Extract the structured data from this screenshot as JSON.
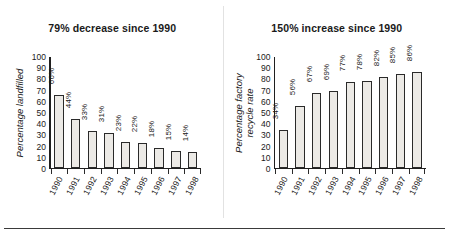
{
  "figure": {
    "bottom_rule": true,
    "divider": true
  },
  "chart_data": [
    {
      "type": "bar",
      "panel": "left",
      "title": "79% decrease since 1990",
      "ylabel": "Percentage landfilled",
      "ylabel_lines": [
        "Percentage landfilled"
      ],
      "xlabel": "",
      "categories": [
        "1990",
        "1991",
        "1992",
        "1993",
        "1994",
        "1995",
        "1996",
        "1997",
        "1998"
      ],
      "values": [
        66,
        44,
        33,
        31,
        23,
        22,
        18,
        15,
        14
      ],
      "value_labels": [
        "66%",
        "44%",
        "33%",
        "31%",
        "23%",
        "22%",
        "18%",
        "15%",
        "14%"
      ],
      "yticks": [
        100,
        90,
        80,
        70,
        60,
        50,
        40,
        30,
        20,
        10,
        0
      ],
      "ytick_labels": [
        "100",
        "90",
        "80",
        "70",
        "60",
        "50",
        "40",
        "30",
        "20",
        "10",
        "0"
      ],
      "ylim": [
        0,
        100
      ],
      "grid": false,
      "legend": false,
      "bar_fill": "#eceae6",
      "bar_edge": "#2a2a2a"
    },
    {
      "type": "bar",
      "panel": "right",
      "title": "150% increase since 1990",
      "ylabel": "Percentage factory recycle rate",
      "ylabel_lines": [
        "Percentage factory",
        "recycle rate"
      ],
      "xlabel": "",
      "categories": [
        "1990",
        "1991",
        "1992",
        "1993",
        "1994",
        "1995",
        "1996",
        "1997",
        "1998"
      ],
      "values": [
        34,
        56,
        67,
        69,
        77,
        78,
        82,
        85,
        86
      ],
      "value_labels": [
        "34%",
        "56%",
        "67%",
        "69%",
        "77%",
        "78%",
        "82%",
        "85%",
        "86%"
      ],
      "yticks": [
        100,
        90,
        80,
        70,
        60,
        50,
        40,
        30,
        20,
        10,
        0
      ],
      "ytick_labels": [
        "100",
        "90",
        "80",
        "70",
        "60",
        "50",
        "40",
        "30",
        "20",
        "10",
        "0"
      ],
      "ylim": [
        0,
        100
      ],
      "grid": false,
      "legend": false,
      "bar_fill": "#eceae6",
      "bar_edge": "#2a2a2a"
    }
  ]
}
